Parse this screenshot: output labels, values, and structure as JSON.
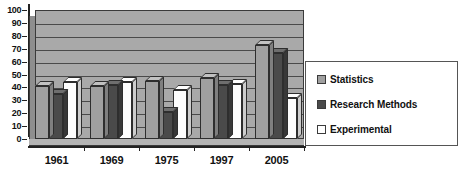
{
  "chart_data": {
    "type": "bar",
    "title": "",
    "subtitle": "",
    "xlabel": "",
    "ylabel": "",
    "ylim": [
      0,
      100
    ],
    "ytick_step": 10,
    "ytick_labels": [
      "100",
      "90",
      "80",
      "70",
      "60",
      "50",
      "40",
      "30",
      "20",
      "10",
      "0"
    ],
    "grid": true,
    "grid_axis": "y",
    "legend_position": "right",
    "style": "3d-clustered-column",
    "plot_background": "#a9a9a9",
    "categories": [
      "1961",
      "1969",
      "1975",
      "1997",
      "2005"
    ],
    "series": [
      {
        "name": "Statistics",
        "color": "#a0a0a0",
        "values": [
          41,
          41,
          45,
          47,
          73
        ]
      },
      {
        "name": "Research Methods",
        "color": "#4a4a4a",
        "values": [
          35,
          42,
          21,
          42,
          67
        ]
      },
      {
        "name": "Experimental",
        "color": "#ffffff",
        "values": [
          44,
          44,
          38,
          43,
          32
        ]
      }
    ]
  },
  "legend": {
    "items": [
      {
        "label": "Statistics",
        "color": "#a0a0a0"
      },
      {
        "label": "Research Methods",
        "color": "#4a4a4a"
      },
      {
        "label": "Experimental",
        "color": "#ffffff"
      }
    ]
  }
}
